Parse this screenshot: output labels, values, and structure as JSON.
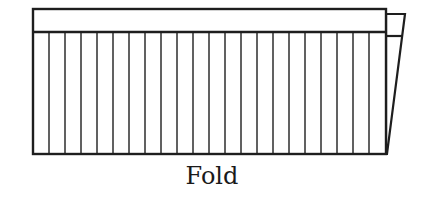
{
  "diagram": {
    "caption": "Fold",
    "colors": {
      "stroke": "#1e1e1e",
      "fill": "#ffffff",
      "text": "#1a1a1a"
    },
    "panel": {
      "x": 33,
      "y": 9,
      "width": 353,
      "height": 145,
      "top_strip_height": 23
    },
    "vertical_lines": {
      "count": 21,
      "first_x": 49,
      "spacing": 16
    },
    "fold_flap": {
      "top_left": [
        386,
        14
      ],
      "top_right": [
        405,
        14
      ],
      "strip_bottom_y": 36,
      "bottom_point": [
        387,
        154
      ]
    }
  }
}
